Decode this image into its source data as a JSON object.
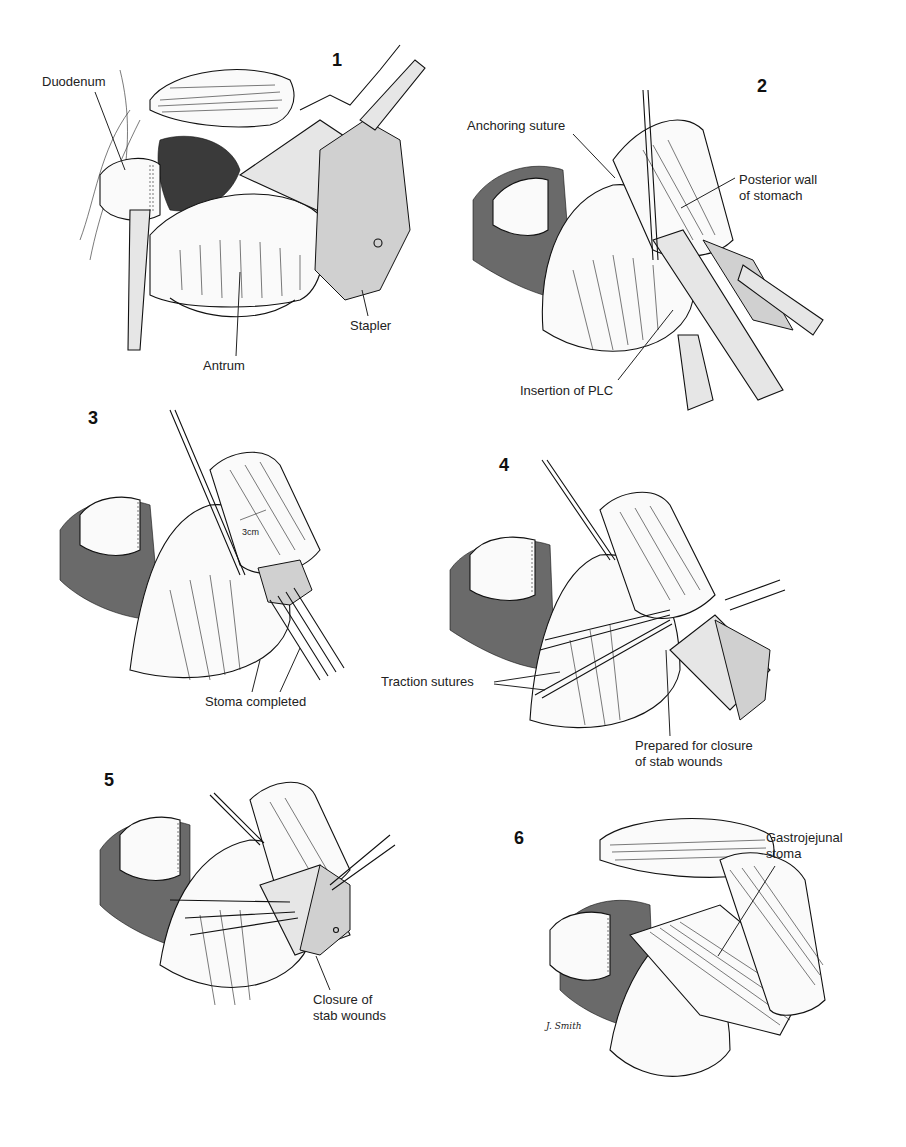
{
  "figure": {
    "signature": "J. Smith",
    "panels": [
      {
        "number": "1",
        "labels": [
          "Duodenum",
          "Stapler",
          "Antrum"
        ]
      },
      {
        "number": "2",
        "labels": [
          "Anchoring suture",
          "Posterior wall\nof stomach",
          "Insertion of PLC"
        ]
      },
      {
        "number": "3",
        "labels": [
          "Stoma completed"
        ],
        "annotation": "3cm"
      },
      {
        "number": "4",
        "labels": [
          "Traction sutures",
          "Prepared for closure\nof stab wounds"
        ]
      },
      {
        "number": "5",
        "labels": [
          "Closure of\nstab wounds"
        ]
      },
      {
        "number": "6",
        "labels": [
          "Gastrojejunal\nstoma"
        ]
      }
    ]
  }
}
